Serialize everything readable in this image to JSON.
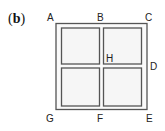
{
  "panel_label": {
    "open": "(",
    "letter": "b",
    "close": ")"
  },
  "points": {
    "A": "A",
    "B": "B",
    "C": "C",
    "D": "D",
    "E": "E",
    "F": "F",
    "G": "G",
    "H": "H"
  },
  "colors": {
    "stroke": "#555555",
    "fill": "#f4f4f4"
  }
}
